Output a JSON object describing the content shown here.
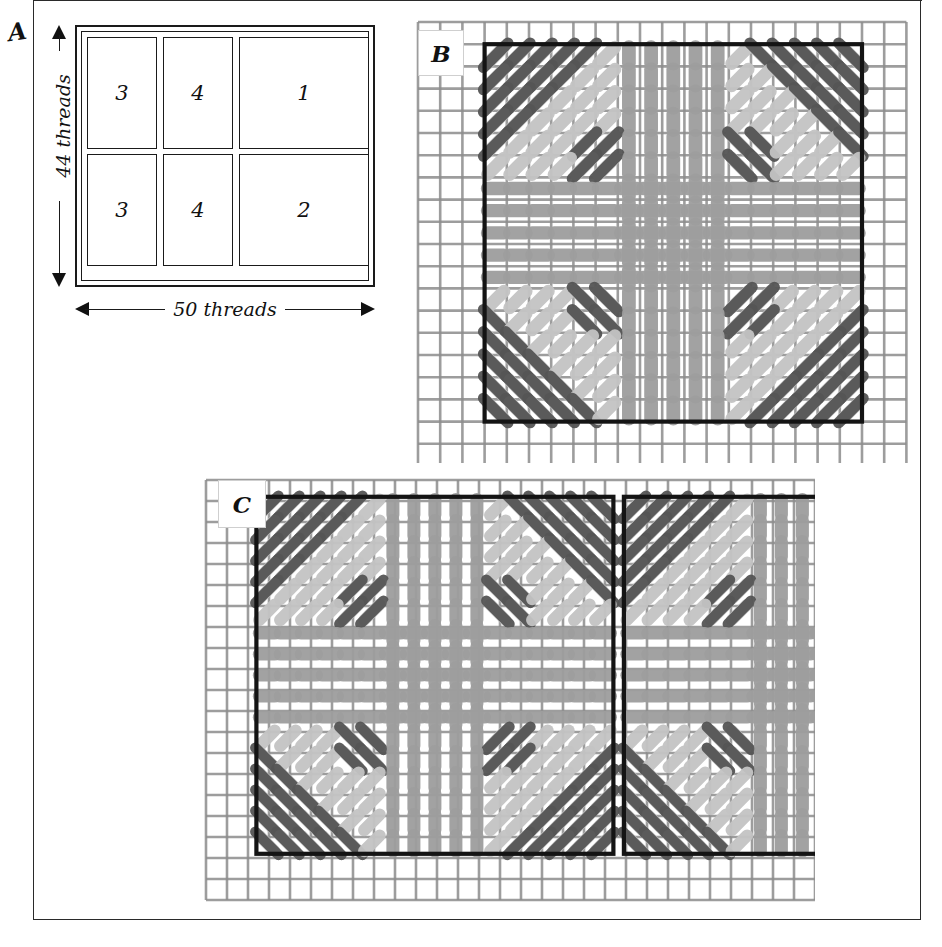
{
  "figure": {
    "type": "needlework-sampler-diagram",
    "panels": [
      "A",
      "B",
      "C"
    ]
  },
  "panel_a": {
    "letter": "A",
    "vertical_dimension": "44 threads",
    "horizontal_dimension": "50 threads",
    "cells": [
      {
        "label": "3",
        "row": 0,
        "col": 0
      },
      {
        "label": "4",
        "row": 0,
        "col": 1
      },
      {
        "label": "1",
        "row": 0,
        "col": 2
      },
      {
        "label": "3",
        "row": 1,
        "col": 0
      },
      {
        "label": "4",
        "row": 1,
        "col": 1
      },
      {
        "label": "2",
        "row": 1,
        "col": 2
      }
    ]
  },
  "panel_b": {
    "letter": "B",
    "motif": "single square block, four-fold symmetric cross-stitch motif on even-weave ground",
    "grid_cells_x": 20,
    "grid_cells_y": 20,
    "border_cells_x": 17,
    "border_cells_y": 17
  },
  "panel_c": {
    "letter": "C",
    "motif": "two adjacent rectangular blocks, each with the four-fold symmetric motif",
    "grid_cells_x": 27,
    "grid_cells_y": 23,
    "blocks": 2
  },
  "colors": {
    "ink": "#1a1a1a",
    "page_border": "#2a2a2a",
    "ground_thread": "#8d8d8d",
    "ground_thread_light": "#b9b9b9",
    "dark_floss": "#555555",
    "mid_floss": "#9e9e9e",
    "light_floss": "#c4c4c4",
    "block_outline": "#141414",
    "paper": "#ffffff"
  }
}
